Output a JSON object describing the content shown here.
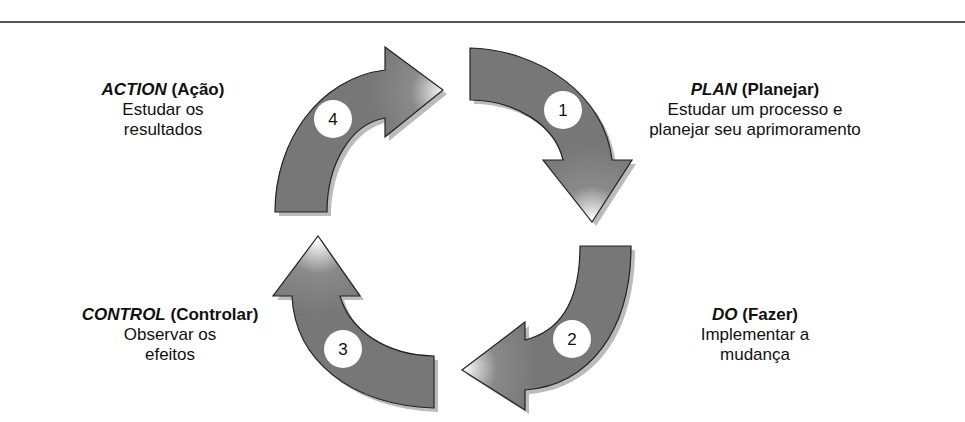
{
  "diagram": {
    "type": "PDCA cycle",
    "steps": [
      {
        "number": "1",
        "keyword": "PLAN",
        "translation": "(Planejar)",
        "line1": "Estudar um processo e",
        "line2": "planejar seu aprimoramento"
      },
      {
        "number": "2",
        "keyword": "DO",
        "translation": "(Fazer)",
        "line1": "Implementar a",
        "line2": "mudança"
      },
      {
        "number": "3",
        "keyword": "CONTROL",
        "translation": "(Controlar)",
        "line1": "Observar os",
        "line2": "efeitos"
      },
      {
        "number": "4",
        "keyword": "ACTION",
        "translation": "(Ação)",
        "line1": "Estudar os",
        "line2": "resultados"
      }
    ],
    "colors": {
      "arrow_fill": "#777777",
      "arrow_stroke": "#222222",
      "shadow": "#bbbbbb",
      "circle": "#ffffff",
      "rule": "#555555"
    }
  }
}
